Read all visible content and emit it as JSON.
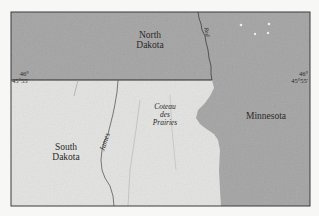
{
  "map": {
    "type": "shaded-relief regional map",
    "colors": {
      "background": "#f7f7f5",
      "dark_region": "#a3a3a3",
      "light_region": "#e2e2e0",
      "border": "#3a3a3a",
      "river": "#555555"
    },
    "regions": [
      {
        "id": "north-dakota",
        "label_line1": "North",
        "label_line2": "Dakota"
      },
      {
        "id": "south-dakota",
        "label_line1": "South",
        "label_line2": "Dakota"
      },
      {
        "id": "minnesota",
        "label": "Minnesota"
      },
      {
        "id": "coteau-des-prairies",
        "label_line1": "Coteau",
        "label_line2": "des",
        "label_line3": "Prairies"
      }
    ],
    "rivers": [
      {
        "id": "james-river",
        "label": "James"
      },
      {
        "id": "red-river",
        "label": "Red"
      }
    ],
    "coordinates": {
      "left": {
        "line1": "46°",
        "line2": "45°55'"
      },
      "right": {
        "line1": "46°",
        "line2": "45°55'"
      }
    }
  }
}
